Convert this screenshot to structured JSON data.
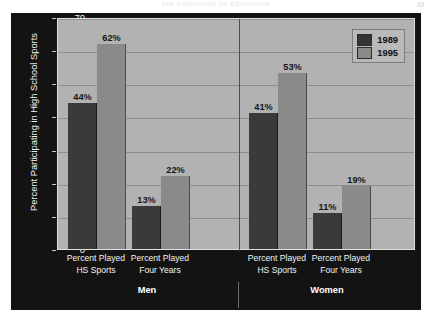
{
  "runhead": {
    "title": "The Condition of Education",
    "page": "33"
  },
  "chart_data": {
    "type": "bar",
    "title": "",
    "xlabel": "",
    "ylabel": "Percent Participating in High School Sports",
    "ylim": [
      0,
      70
    ],
    "yticks": [
      0,
      10,
      20,
      30,
      40,
      50,
      60,
      70
    ],
    "ytick_labels": [
      "0",
      "10",
      "20",
      "30",
      "40",
      "50",
      "60",
      "70"
    ],
    "grid": true,
    "legend_position": "top-right",
    "groups": [
      "Men",
      "Women"
    ],
    "categories": [
      "Percent Played HS Sports",
      "Percent Played Four Years",
      "Percent Played HS Sports",
      "Percent Played Four Years"
    ],
    "category_lines": [
      [
        "Percent Played",
        "HS Sports"
      ],
      [
        "Percent Played",
        "Four Years"
      ],
      [
        "Percent Played",
        "HS Sports"
      ],
      [
        "Percent Played",
        "Four Years"
      ]
    ],
    "series": [
      {
        "name": "1989",
        "color": "#3a3a3a",
        "values": [
          44,
          13,
          41,
          11
        ]
      },
      {
        "name": "1995",
        "color": "#8a8a8a",
        "values": [
          62,
          22,
          53,
          19
        ]
      }
    ],
    "data_labels": [
      [
        "44%",
        "13%",
        "41%",
        "11%"
      ],
      [
        "62%",
        "22%",
        "53%",
        "19%"
      ]
    ]
  },
  "legend": {
    "items": [
      {
        "label": "1989",
        "color": "#3a3a3a"
      },
      {
        "label": "1995",
        "color": "#8a8a8a"
      }
    ]
  },
  "colors": {
    "panel_background": "#131313",
    "plot_background": "#b2b2b2",
    "series_1989": "#3a3a3a",
    "series_1995": "#8a8a8a",
    "gridline": "#8e8e8e",
    "axis_text": "#f2f2f2"
  }
}
